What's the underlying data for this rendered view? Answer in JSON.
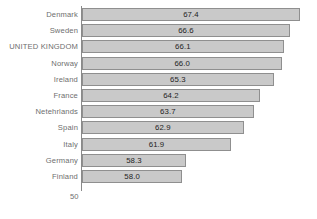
{
  "chart_data": {
    "type": "bar",
    "orientation": "horizontal",
    "title": "",
    "subtitle": "",
    "xlabel": "",
    "ylabel": "",
    "xlim": [
      50,
      68.2
    ],
    "grid": false,
    "legend": null,
    "axis_min_label": "50",
    "categories": [
      "Denmark",
      "Sweden",
      "UNITED KINGDOM",
      "Norway",
      "Ireland",
      "France",
      "Netehrlands",
      "Spain",
      "Italy",
      "Germany",
      "Finland"
    ],
    "values": [
      67.4,
      66.6,
      66.1,
      66.0,
      65.3,
      64.2,
      63.7,
      62.9,
      61.9,
      58.3,
      58.0
    ],
    "value_labels": [
      "67.4",
      "66.6",
      "66.1",
      "66.0",
      "65.3",
      "64.2",
      "63.7",
      "62.9",
      "61.9",
      "58.3",
      "58.0"
    ],
    "bar_fill_color": "#c9c9c9",
    "bar_border_color": "#8f8f8f",
    "label_color": "#6e6e6e",
    "value_color": "#1e1e1e",
    "axis_color": "#8a8a8a",
    "background_color": "#ffffff"
  }
}
